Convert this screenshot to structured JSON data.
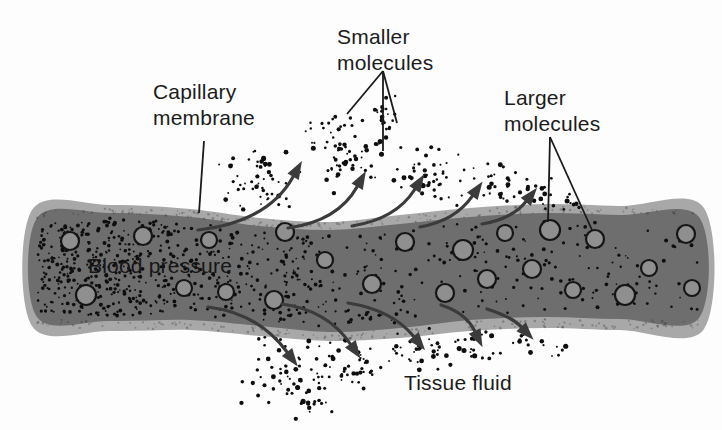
{
  "labels": {
    "capillary_membrane": "Capillary\nmembrane",
    "smaller_molecules": "Smaller\nmolecules",
    "larger_molecules": "Larger\nmolecules",
    "blood_pressure": "Blood pressure",
    "tissue_fluid": "Tissue fluid"
  },
  "colors": {
    "background": "#fdfdfd",
    "membrane": "#a8a8a8",
    "interior": "#6e6e6e",
    "molecule_fill": "#8f8f8f",
    "molecule_stroke": "#151515",
    "speckle": "#0e0e0e",
    "arrow": "#3b3b3b",
    "leader": "#1a1a1a",
    "text": "#1b1b1b"
  },
  "figure": {
    "band": {
      "top_outer": [
        [
          32,
          210
        ],
        [
          110,
          205
        ],
        [
          190,
          209
        ],
        [
          260,
          218
        ],
        [
          330,
          222
        ],
        [
          400,
          215
        ],
        [
          470,
          208
        ],
        [
          545,
          204
        ],
        [
          620,
          206
        ],
        [
          704,
          208
        ]
      ],
      "bottom_outer": [
        [
          32,
          326
        ],
        [
          110,
          331
        ],
        [
          190,
          330
        ],
        [
          260,
          336
        ],
        [
          330,
          341
        ],
        [
          400,
          338
        ],
        [
          470,
          331
        ],
        [
          545,
          328
        ],
        [
          620,
          330
        ],
        [
          704,
          329
        ]
      ],
      "top_inner": [
        [
          37,
          218
        ],
        [
          110,
          213
        ],
        [
          190,
          217
        ],
        [
          260,
          226
        ],
        [
          330,
          230
        ],
        [
          400,
          224
        ],
        [
          470,
          217
        ],
        [
          545,
          213
        ],
        [
          620,
          215
        ],
        [
          699,
          217
        ]
      ],
      "bottom_inner": [
        [
          37,
          317
        ],
        [
          110,
          321
        ],
        [
          190,
          320
        ],
        [
          260,
          326
        ],
        [
          330,
          332
        ],
        [
          400,
          328
        ],
        [
          470,
          320
        ],
        [
          545,
          317
        ],
        [
          620,
          319
        ],
        [
          699,
          318
        ]
      ]
    },
    "molecules": [
      [
        70,
        241,
        9
      ],
      [
        143,
        236,
        9
      ],
      [
        209,
        240,
        8
      ],
      [
        285,
        232,
        9
      ],
      [
        325,
        260,
        8
      ],
      [
        86,
        295,
        10
      ],
      [
        184,
        288,
        8
      ],
      [
        226,
        292,
        8
      ],
      [
        274,
        300,
        9
      ],
      [
        372,
        284,
        9
      ],
      [
        405,
        242,
        9
      ],
      [
        463,
        250,
        10
      ],
      [
        505,
        233,
        8
      ],
      [
        550,
        230,
        10
      ],
      [
        595,
        239,
        9
      ],
      [
        686,
        234,
        9
      ],
      [
        445,
        293,
        9
      ],
      [
        487,
        279,
        9
      ],
      [
        532,
        269,
        9
      ],
      [
        573,
        290,
        8
      ],
      [
        625,
        295,
        10
      ],
      [
        649,
        268,
        8
      ],
      [
        692,
        288,
        8
      ]
    ],
    "arrows_up": [
      {
        "s": [
          198,
          230
        ],
        "c": [
          268,
          222
        ],
        "e": [
          298,
          168
        ]
      },
      {
        "s": [
          288,
          228
        ],
        "c": [
          338,
          221
        ],
        "e": [
          362,
          178
        ]
      },
      {
        "s": [
          352,
          226
        ],
        "c": [
          396,
          219
        ],
        "e": [
          420,
          181
        ]
      },
      {
        "s": [
          420,
          227
        ],
        "c": [
          455,
          221
        ],
        "e": [
          478,
          188
        ]
      },
      {
        "s": [
          482,
          224
        ],
        "c": [
          512,
          219
        ],
        "e": [
          532,
          194
        ]
      }
    ],
    "arrows_down": [
      {
        "s": [
          208,
          307
        ],
        "c": [
          258,
          313
        ],
        "e": [
          293,
          360
        ]
      },
      {
        "s": [
          282,
          304
        ],
        "c": [
          327,
          310
        ],
        "e": [
          356,
          352
        ]
      },
      {
        "s": [
          348,
          303
        ],
        "c": [
          392,
          310
        ],
        "e": [
          420,
          344
        ]
      },
      {
        "s": [
          441,
          305
        ],
        "c": [
          466,
          313
        ],
        "e": [
          479,
          340
        ]
      },
      {
        "s": [
          487,
          309
        ],
        "c": [
          512,
          317
        ],
        "e": [
          528,
          334
        ]
      }
    ],
    "leaders": {
      "capillary_line": [
        [
          204,
          141
        ],
        [
          199,
          213
        ]
      ],
      "smaller_fan": {
        "apex": [
          383,
          71
        ],
        "ends": [
          [
            347,
            114
          ],
          [
            383,
            151
          ],
          [
            397,
            123
          ]
        ]
      },
      "larger_fan": {
        "apex": [
          550,
          137
        ],
        "ends": [
          [
            548,
            222
          ],
          [
            592,
            230
          ]
        ]
      }
    },
    "dot_clusters_above": [
      [
        262,
        180,
        45,
        40,
        55
      ],
      [
        345,
        148,
        42,
        48,
        65
      ],
      [
        383,
        118,
        16,
        35,
        22
      ],
      [
        425,
        172,
        40,
        33,
        42
      ],
      [
        488,
        182,
        34,
        26,
        28
      ],
      [
        538,
        192,
        26,
        18,
        16
      ],
      [
        568,
        200,
        16,
        12,
        8
      ]
    ],
    "dot_clusters_below": [
      [
        285,
        370,
        45,
        38,
        55
      ],
      [
        312,
        404,
        24,
        18,
        14
      ],
      [
        355,
        363,
        40,
        30,
        42
      ],
      [
        420,
        351,
        36,
        24,
        32
      ],
      [
        478,
        345,
        28,
        19,
        20
      ],
      [
        528,
        340,
        20,
        13,
        10
      ],
      [
        558,
        350,
        13,
        9,
        5
      ]
    ],
    "speckles": {
      "base": 520,
      "extra_left": 210,
      "extra_mid": 110,
      "seed": 20240
    }
  }
}
